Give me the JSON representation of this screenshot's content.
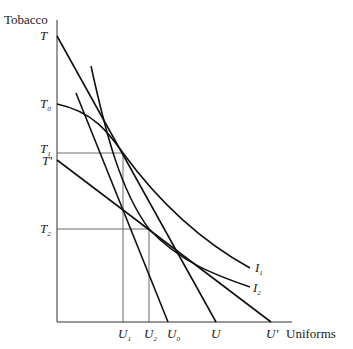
{
  "diagram": {
    "y_axis_label": "Tobacco",
    "x_axis_label": "Uniforms",
    "y_ticks": [
      {
        "id": "T",
        "base": "T",
        "sub": "",
        "prime": "",
        "y": 40
      },
      {
        "id": "T0",
        "base": "T",
        "sub": "0",
        "prime": "",
        "y": 108
      },
      {
        "id": "T1",
        "base": "T",
        "sub": "1",
        "prime": "",
        "y": 153
      },
      {
        "id": "Tprime",
        "base": "T",
        "sub": "",
        "prime": "'",
        "y": 165
      },
      {
        "id": "T2",
        "base": "T",
        "sub": "2",
        "prime": "",
        "y": 233
      }
    ],
    "x_ticks": [
      {
        "id": "U1",
        "base": "U",
        "sub": "1",
        "prime": "",
        "x": 123
      },
      {
        "id": "U2",
        "base": "U",
        "sub": "2",
        "prime": "",
        "x": 149
      },
      {
        "id": "U0",
        "base": "U",
        "sub": "0",
        "prime": "",
        "x": 172
      },
      {
        "id": "U",
        "base": "U",
        "sub": "",
        "prime": "",
        "x": 216
      },
      {
        "id": "Uprime",
        "base": "U",
        "sub": "",
        "prime": "'",
        "x": 271
      }
    ],
    "curve_labels": [
      {
        "id": "I1",
        "base": "I",
        "sub": "1",
        "x": 255,
        "y": 272
      },
      {
        "id": "I2",
        "base": "I",
        "sub": "2",
        "x": 253,
        "y": 292
      }
    ]
  }
}
